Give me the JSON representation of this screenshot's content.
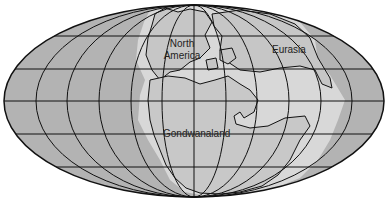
{
  "map": {
    "projection": "Mollweide (elliptical)",
    "labels": {
      "north_america_line1": "North",
      "north_america_line2": "America",
      "eurasia": "Eurasia",
      "gondwanaland": "Gondwanaland"
    },
    "colors": {
      "ocean": "#b3b3b3",
      "shelf": "#d6d6d6",
      "land": "#c4c4c4",
      "outline": "#111111",
      "background": "#ffffff"
    }
  }
}
